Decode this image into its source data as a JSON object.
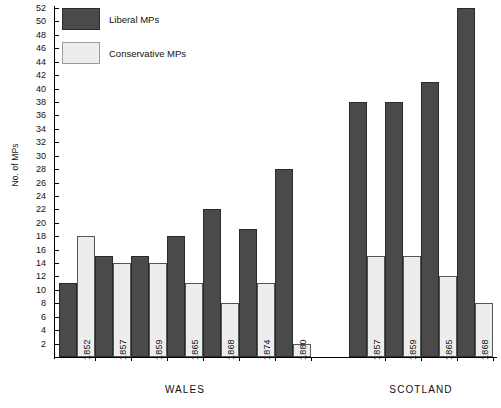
{
  "chart_data": {
    "type": "bar",
    "title": "",
    "xlabel": "",
    "ylabel": "No. of MPs",
    "ylim": [
      0,
      52
    ],
    "ytick_step": 2,
    "yticks": [
      2,
      4,
      6,
      8,
      10,
      12,
      14,
      16,
      18,
      20,
      22,
      24,
      26,
      28,
      30,
      32,
      34,
      36,
      38,
      40,
      42,
      44,
      46,
      48,
      50,
      52
    ],
    "grid": false,
    "legend_position": "top-left",
    "groups": [
      {
        "name": "WALES",
        "categories": [
          "1852",
          "1857",
          "1859",
          "1865",
          "1868",
          "1874",
          "1880"
        ],
        "series": [
          {
            "name": "Liberal MPs",
            "values": [
              11,
              15,
              15,
              18,
              22,
              19,
              28
            ]
          },
          {
            "name": "Conservative MPs",
            "values": [
              18,
              14,
              14,
              11,
              8,
              11,
              2
            ]
          }
        ]
      },
      {
        "name": "SCOTLAND",
        "categories": [
          "1857",
          "1859",
          "1865",
          "1868"
        ],
        "series": [
          {
            "name": "Liberal MPs",
            "values": [
              38,
              38,
              41,
              52
            ]
          },
          {
            "name": "Conservative MPs",
            "values": [
              15,
              15,
              12,
              8
            ]
          }
        ]
      }
    ],
    "series_names": [
      "Liberal MPs",
      "Conservative MPs"
    ],
    "colors": {
      "liberal": "#4a4a4a",
      "conservative": "#ededed"
    }
  },
  "legend": {
    "items": [
      {
        "label": "Liberal MPs",
        "color": "#4a4a4a"
      },
      {
        "label": "Conservative MPs",
        "color": "#ededed"
      }
    ]
  },
  "axis": {
    "y_title": "No. of MPs"
  }
}
